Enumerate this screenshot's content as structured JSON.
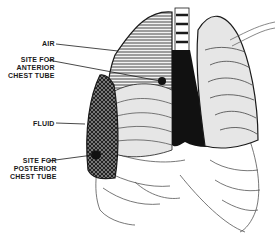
{
  "diagram": {
    "labels": {
      "air": "AIR",
      "anterior": [
        "SITE FOR",
        "ANTERIOR",
        "CHEST TUBE"
      ],
      "fluid": "FLUID",
      "posterior": [
        "SITE FOR",
        "POSTERIOR",
        "CHEST TUBE"
      ]
    },
    "colors": {
      "outline": "#1a1a1a",
      "lung_fill": "#e6e6e6",
      "heart": "#111111",
      "background": "#ffffff"
    }
  }
}
